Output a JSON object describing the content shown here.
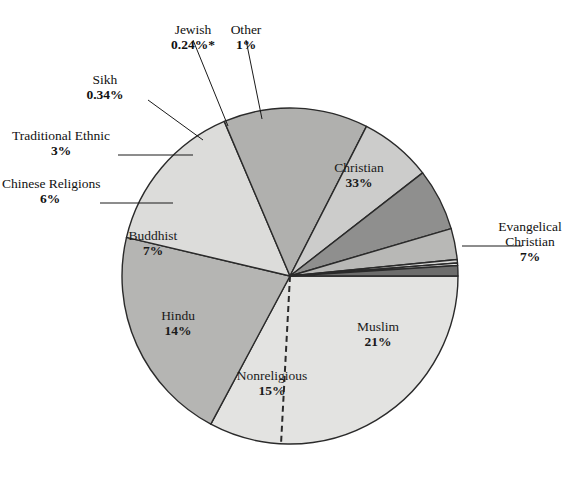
{
  "figure": {
    "type": "pie-chart",
    "footnote_marker": "*"
  },
  "labels": {
    "jewish": {
      "name": "Jewish",
      "pct": "0.24%*"
    },
    "other": {
      "name": "Other",
      "pct": "1%"
    },
    "sikh": {
      "name": "Sikh",
      "pct": "0.34%"
    },
    "traditional_ethnic": {
      "name": "Traditional Ethnic",
      "pct": "3%"
    },
    "chinese_religions": {
      "name": "Chinese Religions",
      "pct": "6%"
    },
    "buddhist": {
      "name": "Buddhist",
      "pct": "7%"
    },
    "hindu": {
      "name": "Hindu",
      "pct": "14%"
    },
    "nonreligious": {
      "name": "Nonreligious",
      "pct": "15%"
    },
    "muslim": {
      "name": "Muslim",
      "pct": "21%"
    },
    "christian": {
      "name": "Christian",
      "pct": "33%"
    },
    "evangelical_line1": {
      "name": "Evangelical"
    },
    "evangelical": {
      "name": "Christian",
      "pct": "7%"
    }
  },
  "chart_data": {
    "type": "pie",
    "title": "",
    "categories": [
      "Christian",
      "Muslim",
      "Nonreligious",
      "Hindu",
      "Buddhist",
      "Chinese Religions",
      "Traditional Ethnic",
      "Sikh",
      "Jewish",
      "Other"
    ],
    "values": [
      33,
      21,
      15,
      14,
      7,
      6,
      3,
      0.34,
      0.24,
      1
    ],
    "value_labels": [
      "33%",
      "21%",
      "15%",
      "14%",
      "7%",
      "6%",
      "3%",
      "0.34%",
      "0.24%*",
      "1%"
    ],
    "colors": [
      "#e3e3e1",
      "#b5b5b3",
      "#dcdcda",
      "#b0b0ae",
      "#cccccb",
      "#8f8f8e",
      "#b8b8b6",
      "#d8d8d6",
      "#f2f2f0",
      "#6d6d6c"
    ],
    "sub_slices": [
      {
        "parent": "Christian",
        "name": "Evangelical Christian",
        "value": 7,
        "value_label": "7%",
        "separator": "dashed"
      }
    ],
    "start_angle_deg": 0,
    "direction": "clockwise",
    "legend": "none",
    "grid": false,
    "stroke_color": "#2a2a2a",
    "background": "#ffffff"
  },
  "geometry": {
    "center_x": 290,
    "center_y": 276,
    "radius": 168
  }
}
